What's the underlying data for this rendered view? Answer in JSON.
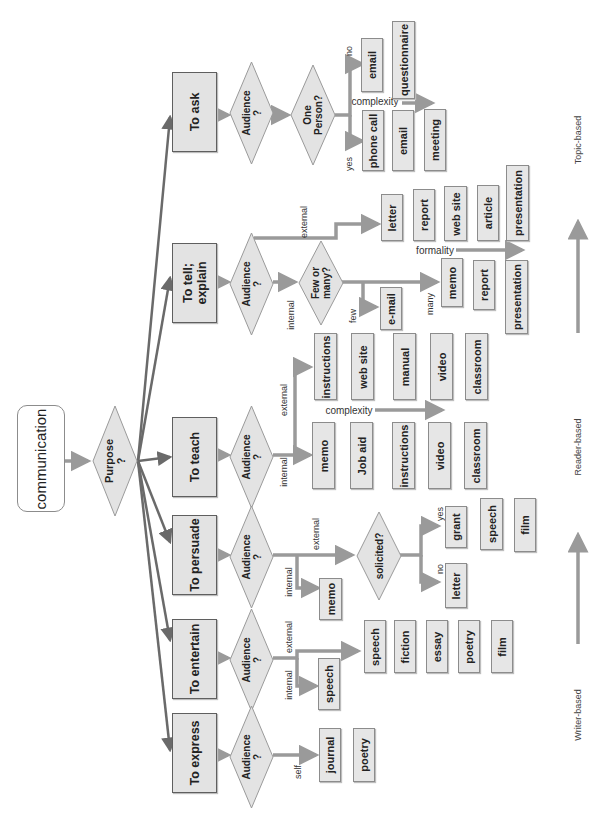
{
  "diagram": {
    "start": "communication",
    "purpose_question": "Purpose\n?",
    "audience_question": "Audience\n?",
    "purposes": [
      {
        "label": "To ask"
      },
      {
        "label": "To tell;\nexplain"
      },
      {
        "label": "To teach"
      },
      {
        "label": "To persuade"
      },
      {
        "label": "To entertain"
      },
      {
        "label": "To express"
      }
    ],
    "ask": {
      "question": "One\nPerson?",
      "branch_no": "no",
      "branch_yes": "yes",
      "axis_label": "complexity",
      "no_outputs": [
        "email",
        "questionnaire"
      ],
      "yes_outputs": [
        "phone call",
        "email",
        "meeting"
      ]
    },
    "tell": {
      "branch_external": "external",
      "branch_internal": "internal",
      "question": "Few or\nmany?",
      "branch_few": "few",
      "branch_many": "many",
      "axis_label": "formality",
      "external_outputs": [
        "letter",
        "report",
        "web site",
        "article",
        "presentation"
      ],
      "few_outputs": [
        "e-mail"
      ],
      "many_outputs": [
        "memo",
        "report",
        "presentation"
      ]
    },
    "teach": {
      "branch_external": "external",
      "branch_internal": "internal",
      "axis_label": "complexity",
      "external_outputs": [
        "instructions",
        "web site",
        "manual",
        "video",
        "classroom"
      ],
      "internal_outputs": [
        "memo",
        "Job aid",
        "instructions",
        "video",
        "classroom"
      ]
    },
    "persuade": {
      "branch_external": "external",
      "branch_internal": "internal",
      "question": "solicited?",
      "branch_yes": "yes",
      "branch_no": "no",
      "internal_outputs": [
        "memo"
      ],
      "yes_outputs": [
        "grant",
        "speech",
        "film"
      ],
      "no_outputs": [
        "letter"
      ]
    },
    "entertain": {
      "branch_external": "external",
      "branch_internal": "internal",
      "internal_outputs": [
        "speech"
      ],
      "external_outputs": [
        "speech",
        "fiction",
        "essay",
        "poetry",
        "film"
      ]
    },
    "express": {
      "branch_self": "self",
      "outputs": [
        "journal",
        "poetry"
      ]
    },
    "scale": {
      "labels": [
        "Writer-based",
        "Reader-based",
        "Topic-based"
      ]
    }
  }
}
